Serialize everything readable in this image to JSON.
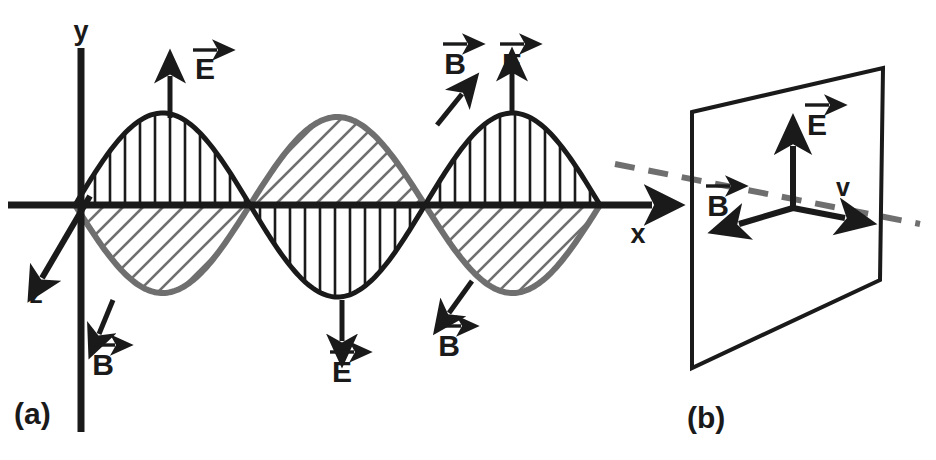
{
  "figure": {
    "background_color": "#ffffff",
    "ink_color": "#1a1a1a",
    "gray_color": "#6f6f6f",
    "width": 936,
    "height": 460
  },
  "panel_a": {
    "caption": "(a)",
    "axes": {
      "y_label": "y",
      "x_label": "x",
      "z_label": "z"
    },
    "wave_e": {
      "symbol": "E",
      "color": "#1a1a1a",
      "hatch": "vertical",
      "amplitude": 92,
      "half_period": 175,
      "description": "electric field wave, black outline with vertical hatching"
    },
    "wave_b": {
      "symbol": "B",
      "color": "#6f6f6f",
      "hatch": "diagonal",
      "amplitude": 88,
      "half_period": 175,
      "description": "magnetic field wave, gray outline with diagonal hatching"
    },
    "vector_labels": [
      {
        "name": "e-up-first",
        "symbol": "E",
        "direction": "up"
      },
      {
        "name": "b-down-left-origin",
        "symbol": "B",
        "direction": "down-left"
      },
      {
        "name": "e-down-middle",
        "symbol": "E",
        "direction": "down"
      },
      {
        "name": "b-down-left-third",
        "symbol": "B",
        "direction": "down-left"
      },
      {
        "name": "b-up-right-third",
        "symbol": "B",
        "direction": "up-right"
      },
      {
        "name": "e-up-third",
        "symbol": "E",
        "direction": "up"
      }
    ]
  },
  "panel_b": {
    "caption": "(b)",
    "plane_description": "wavefront plane drawn in perspective",
    "dashed_line_color": "#6f6f6f",
    "vectors": [
      {
        "name": "e-vector",
        "symbol": "E",
        "direction": "up"
      },
      {
        "name": "b-vector",
        "symbol": "B",
        "direction": "down-left"
      },
      {
        "name": "v-vector",
        "symbol": "v",
        "direction": "right"
      }
    ]
  },
  "chart_data": {
    "type": "line",
    "xlabel": "x",
    "ylabel": "y",
    "zlabel": "z",
    "x_axis_y_pixel": 205,
    "series": [
      {
        "name": "E",
        "color": "#1a1a1a",
        "hatch": "vertical",
        "function": "+A sin(2*pi*x / 350)",
        "amplitude": 92,
        "wavelength": 350,
        "phase_deg": 0,
        "zero_crossings_px": [
          75,
          250,
          425,
          600
        ],
        "peaks_px": [
          162,
          512
        ],
        "troughs_px": [
          337
        ]
      },
      {
        "name": "B",
        "color": "#6f6f6f",
        "hatch": "diagonal",
        "function": "-A sin(2*pi*x / 350)",
        "amplitude": 88,
        "wavelength": 350,
        "phase_deg": 180,
        "zero_crossings_px": [
          75,
          250,
          425,
          600
        ],
        "peaks_px": [
          337
        ],
        "troughs_px": [
          162,
          512
        ]
      }
    ],
    "legend": [
      "E",
      "B"
    ],
    "grid": false,
    "annotations": [
      "E",
      "B",
      "E",
      "B",
      "B",
      "E",
      "y",
      "x",
      "z",
      "v",
      "(a)",
      "(b)"
    ]
  }
}
